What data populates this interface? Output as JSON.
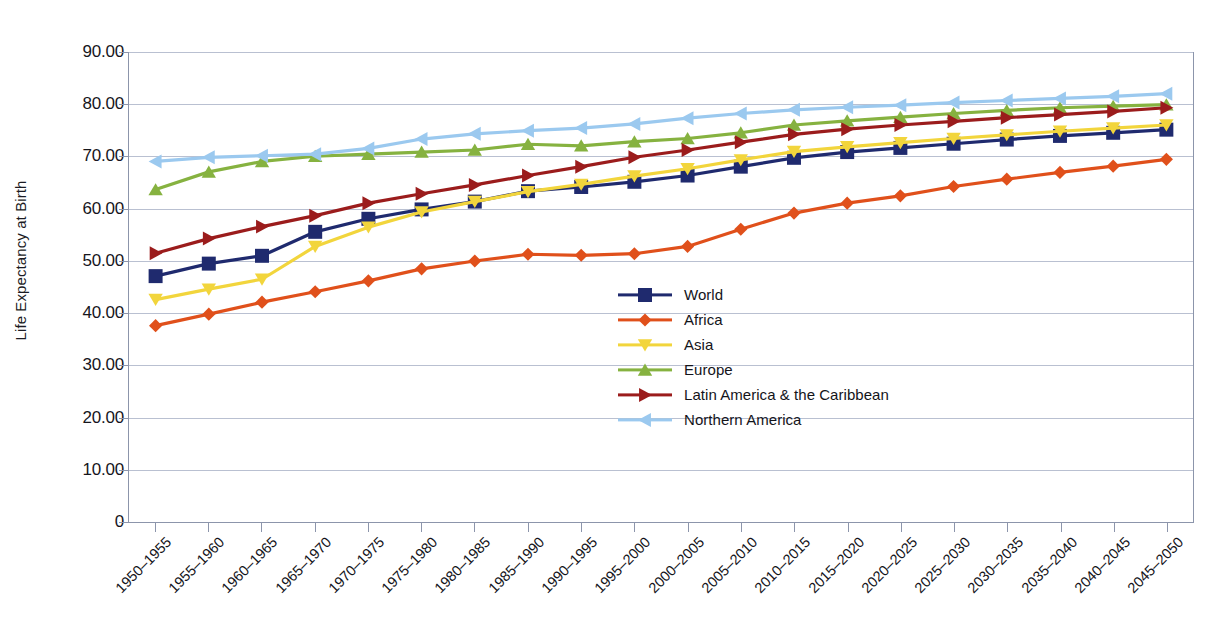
{
  "chart_data": {
    "type": "line",
    "title": "",
    "xlabel": "",
    "ylabel": "Life Expectancy at Birth",
    "ylim": [
      0,
      90
    ],
    "grid": true,
    "legend_position": "center",
    "ytick_labels": [
      "90.00",
      "80.00",
      "70.00",
      "60.00",
      "50.00",
      "40.00",
      "30.00",
      "20.00",
      "10.00",
      "0"
    ],
    "ytick_values": [
      90,
      80,
      70,
      60,
      50,
      40,
      30,
      20,
      10,
      0
    ],
    "categories": [
      "1950–1955",
      "1955–1960",
      "1960–1965",
      "1965–1970",
      "1970–1975",
      "1975–1980",
      "1980–1985",
      "1985–1990",
      "1990–1995",
      "1995–2000",
      "2000–2005",
      "2005–2010",
      "2010–2015",
      "2015–2020",
      "2020–2025",
      "2025–2030",
      "2030–2035",
      "2035–2040",
      "2040–2045",
      "2045–2050"
    ],
    "series": [
      {
        "name": "World",
        "color": "#1f2a6e",
        "marker": "square",
        "values": [
          47.0,
          49.4,
          50.9,
          55.5,
          58.0,
          59.8,
          61.3,
          63.3,
          64.1,
          65.1,
          66.3,
          68.0,
          69.7,
          70.8,
          71.6,
          72.4,
          73.2,
          73.9,
          74.5,
          75.1
        ]
      },
      {
        "name": "Africa",
        "color": "#e0501b",
        "marker": "diamond",
        "values": [
          37.5,
          39.7,
          42.0,
          44.0,
          46.1,
          48.4,
          49.9,
          51.2,
          51.0,
          51.3,
          52.7,
          56.0,
          59.1,
          61.0,
          62.4,
          64.2,
          65.6,
          66.9,
          68.1,
          69.4
        ]
      },
      {
        "name": "Asia",
        "color": "#f2d53c",
        "marker": "triangle-down",
        "values": [
          42.5,
          44.5,
          46.4,
          52.7,
          56.4,
          59.3,
          61.3,
          63.2,
          64.6,
          66.2,
          67.6,
          69.3,
          70.9,
          71.8,
          72.6,
          73.4,
          74.1,
          74.8,
          75.4,
          76.0
        ]
      },
      {
        "name": "Europe",
        "color": "#86b240",
        "marker": "triangle-up",
        "values": [
          63.6,
          67.0,
          69.0,
          70.0,
          70.4,
          70.8,
          71.2,
          72.3,
          72.0,
          72.8,
          73.4,
          74.5,
          76.0,
          76.8,
          77.5,
          78.2,
          78.8,
          79.3,
          79.6,
          79.9
        ]
      },
      {
        "name": "Latin America & the Caribbean",
        "color": "#9b1c1c",
        "marker": "triangle-right",
        "values": [
          51.4,
          54.2,
          56.5,
          58.6,
          61.0,
          62.8,
          64.5,
          66.3,
          68.0,
          69.8,
          71.2,
          72.7,
          74.2,
          75.2,
          76.0,
          76.7,
          77.4,
          78.0,
          78.6,
          79.3
        ]
      },
      {
        "name": "Northern America",
        "color": "#9bc9ef",
        "marker": "triangle-left",
        "values": [
          69.0,
          69.8,
          70.1,
          70.4,
          71.5,
          73.3,
          74.3,
          74.9,
          75.4,
          76.2,
          77.3,
          78.2,
          78.9,
          79.4,
          79.8,
          80.3,
          80.7,
          81.1,
          81.5,
          82.0
        ]
      }
    ]
  }
}
